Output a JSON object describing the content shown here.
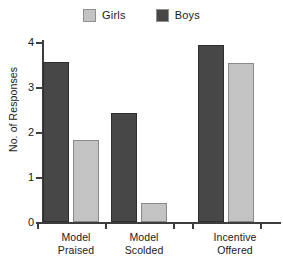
{
  "chart_data": {
    "type": "bar",
    "title": "",
    "xlabel": "",
    "ylabel": "No. of Responses",
    "ylim": [
      0,
      4
    ],
    "yticks": [
      0,
      1,
      2,
      3,
      4
    ],
    "ytick_labels": [
      "0",
      "1",
      "2",
      "3",
      "4"
    ],
    "grid": false,
    "legend_position": "top-center",
    "categories": [
      "Model Praised",
      "Model Scolded",
      "Incentive Offered"
    ],
    "category_lines": [
      [
        "Model",
        "Praised"
      ],
      [
        "Model",
        "Scolded"
      ],
      [
        "Incentive",
        "Offered"
      ]
    ],
    "series": [
      {
        "name": "Boys",
        "color": "#474747",
        "values": [
          3.55,
          2.42,
          3.93
        ]
      },
      {
        "name": "Girls",
        "color": "#c3c3c3",
        "values": [
          1.82,
          0.42,
          3.53
        ]
      }
    ],
    "series_order_in_plot": [
      "Boys",
      "Girls"
    ],
    "legend": [
      {
        "label": "Girls",
        "color": "#c3c3c3"
      },
      {
        "label": "Boys",
        "color": "#474747"
      }
    ]
  },
  "axes": {
    "y_title": "No. of Responses",
    "y_tick_0": "0",
    "y_tick_1": "1",
    "y_tick_2": "2",
    "y_tick_3": "3",
    "y_tick_4": "4"
  },
  "groups": [
    {
      "line1": "Model",
      "line2": "Praised"
    },
    {
      "line1": "Model",
      "line2": "Scolded"
    },
    {
      "line1": "Incentive",
      "line2": "Offered"
    }
  ],
  "legend": {
    "girls_label": "Girls",
    "boys_label": "Boys"
  }
}
